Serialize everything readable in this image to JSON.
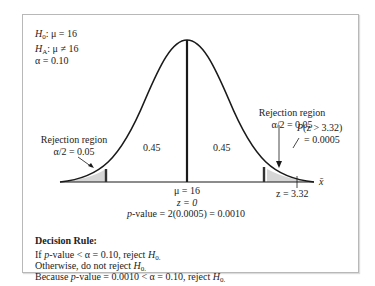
{
  "hypotheses": {
    "null": {
      "symbol": "H",
      "sub": "0",
      "rest": ": μ = 16"
    },
    "alt": {
      "symbol": "H",
      "sub": "A",
      "rest": ": μ ≠ 16"
    },
    "alpha": "α = 0.10"
  },
  "diagram": {
    "left_region": {
      "title": "Rejection region",
      "alpha_half": "α/2 = 0.05"
    },
    "right_region": {
      "title": "Rejection region",
      "alpha_half": "α/2 = 0.05"
    },
    "left_area": "0.45",
    "right_area": "0.45",
    "mean_label": "μ = 16",
    "z_center": "z = 0",
    "p_value_line": {
      "p": "p",
      "rest": "-value = 2(0.0005) = 0.0010"
    },
    "tail_prob": {
      "line1_p": "P",
      "line1_rest": "(z > 3.32)",
      "line2": "= 0.0005"
    },
    "z_stat": "z = 3.32",
    "axis_label": "x̄",
    "colors": {
      "curve": "#1a1a1a",
      "shade": "#d6d6d6",
      "border": "#b8b8b8"
    }
  },
  "decision": {
    "heading": "Decision Rule:",
    "rule1": {
      "pre": "If ",
      "p": "p",
      "mid": "-value < α = 0.10, reject ",
      "H": "H",
      "sub": "0."
    },
    "rule2": {
      "pre": "Otherwise, do not reject ",
      "H": "H",
      "sub": "0."
    },
    "rule3": {
      "pre": "Because ",
      "p": "p",
      "mid": "-value = 0.0010 < α = 0.10, reject ",
      "H": "H",
      "sub": "0."
    }
  }
}
